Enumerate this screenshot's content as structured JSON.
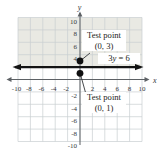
{
  "figure": {
    "width": 165,
    "height": 156,
    "colors": {
      "background": "#ffffff",
      "grid": "#c9ced1",
      "axis": "#5d6165",
      "tick_text": "#35383b",
      "equation_line": "#141414",
      "point": "#101010",
      "shade": "#e9e9e3",
      "annotation_text": "#1c1e20",
      "callout_bg": "#ffffff"
    }
  },
  "chart_data": {
    "type": "line",
    "xlabel": "x",
    "ylabel": "y",
    "x_range": [
      -10,
      10
    ],
    "y_range": [
      -10,
      10
    ],
    "grid_step": 2,
    "grid_on": true,
    "x_ticks": [
      "-10",
      "-8",
      "-6",
      "-4",
      "-2",
      "2",
      "4",
      "6",
      "8",
      "10"
    ],
    "x_tick_values": [
      -10,
      -8,
      -6,
      -4,
      -2,
      2,
      4,
      6,
      8,
      10
    ],
    "y_ticks": [
      "10",
      "8",
      "6",
      "4",
      "-2",
      "-4",
      "-6",
      "-8",
      "-10"
    ],
    "y_tick_values": [
      10,
      8,
      6,
      4,
      -2,
      -4,
      -6,
      -8,
      -10
    ],
    "line": {
      "equation": "3y = 6",
      "orientation": "horizontal",
      "y_value": 2,
      "label": "3y = 6",
      "label_parts": [
        {
          "t": "3",
          "i": false
        },
        {
          "t": "y",
          "i": true
        },
        {
          "t": " = 6",
          "i": false
        }
      ]
    },
    "shaded_region": "y > 2",
    "points": [
      {
        "x": 0,
        "y": 3,
        "label": "Test point",
        "coords": "(0, 3)"
      },
      {
        "x": 0,
        "y": 1,
        "label": "Test point",
        "coords": "(0, 1)"
      }
    ]
  }
}
